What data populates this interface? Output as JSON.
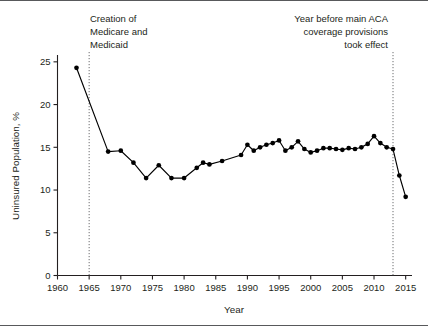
{
  "chart_data": {
    "type": "line",
    "title": "",
    "subtitle": "",
    "xlabel": "Year",
    "ylabel": "Uninsured Population, %",
    "xlim": [
      1960,
      2016
    ],
    "ylim": [
      0,
      25.8
    ],
    "xticks": [
      1960,
      1965,
      1970,
      1975,
      1980,
      1985,
      1990,
      1995,
      2000,
      2005,
      2010,
      2015
    ],
    "yticks": [
      0,
      5,
      10,
      15,
      20,
      25
    ],
    "grid": false,
    "legend": null,
    "marker": "filled-circle",
    "line_color": "#000000",
    "marker_color": "#000000",
    "series": [
      {
        "name": "Uninsured Population",
        "x": [
          1963,
          1968,
          1970,
          1972,
          1974,
          1976,
          1978,
          1980,
          1982,
          1983,
          1984,
          1986,
          1989,
          1990,
          1991,
          1992,
          1993,
          1994,
          1995,
          1996,
          1997,
          1998,
          1999,
          2000,
          2001,
          2002,
          2003,
          2004,
          2005,
          2006,
          2007,
          2008,
          2009,
          2010,
          2011,
          2012,
          2013,
          2014,
          2015
        ],
        "values": [
          24.3,
          14.5,
          14.6,
          13.2,
          11.4,
          12.9,
          11.4,
          11.4,
          12.6,
          13.2,
          13.0,
          13.4,
          14.1,
          15.3,
          14.6,
          15.0,
          15.3,
          15.5,
          15.8,
          14.6,
          15.0,
          15.7,
          14.8,
          14.4,
          14.6,
          14.9,
          14.9,
          14.8,
          14.7,
          14.9,
          14.8,
          15.0,
          15.4,
          16.3,
          15.5,
          15.0,
          14.8,
          11.7,
          9.2
        ]
      }
    ],
    "reference_lines": [
      {
        "name": "medicare-medicaid",
        "x": 1965,
        "style": "dotted",
        "label": [
          "Creation of",
          "Medicare and",
          "Medicaid"
        ],
        "label_align": "left"
      },
      {
        "name": "aca-coverage",
        "x": 2013,
        "style": "dotted",
        "label": [
          "Year before main ACA",
          "coverage provisions",
          "took effect"
        ],
        "label_align": "right"
      }
    ]
  },
  "axes": {
    "y_tick_labels": [
      "25",
      "20",
      "15",
      "10",
      "5",
      "0"
    ],
    "x_tick_labels": [
      "1960",
      "1965",
      "1970",
      "1975",
      "1980",
      "1985",
      "1990",
      "1995",
      "2000",
      "2005",
      "2010",
      "2015"
    ],
    "x_axis_title": "Year",
    "y_axis_title": "Uninsured Population, %"
  },
  "annotations": {
    "left": {
      "line1": "Creation of",
      "line2": "Medicare and",
      "line3": "Medicaid"
    },
    "right": {
      "line1": "Year before main ACA",
      "line2": "coverage provisions",
      "line3": "took effect"
    }
  },
  "colors": {
    "line": "#000000",
    "axis": "#231f20",
    "frame_rule": "#58595b",
    "background": "#ffffff",
    "reference_line": "#6d6e71"
  }
}
